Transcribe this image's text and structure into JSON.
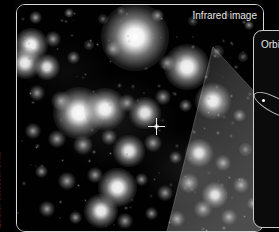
{
  "figure": {
    "credit": "ESO/S. Gillessen et al.",
    "background_color": "#000000"
  },
  "image_panel": {
    "label": "Infrared image",
    "border_color": "#d8d8d8",
    "marker": {
      "name": "central-source-crosshair",
      "description": "crosshair"
    }
  },
  "orbit_panel": {
    "label": "Orbit",
    "border_color": "#c9c9c9",
    "background_color": "#0b0b0b"
  },
  "chart_data": {
    "type": "scatter",
    "title": "Infrared image",
    "xlabel": "",
    "ylabel": "",
    "legend": [
      "Infrared image",
      "Orbit"
    ],
    "annotations": [
      "Infrared image",
      "Orbit",
      "ESO/S. Gillessen et al."
    ],
    "grid": false,
    "xlim": [
      0,
      246
    ],
    "ylim": [
      0,
      226
    ],
    "series": [
      {
        "name": "stars",
        "points": [
          {
            "x": 18,
            "y": 12,
            "brightness": 0.5,
            "size": 5
          },
          {
            "x": 52,
            "y": 8,
            "brightness": 0.45,
            "size": 4
          },
          {
            "x": 86,
            "y": 14,
            "brightness": 0.4,
            "size": 4
          },
          {
            "x": 104,
            "y": 6,
            "brightness": 0.35,
            "size": 3
          },
          {
            "x": 140,
            "y": 10,
            "brightness": 0.55,
            "size": 5
          },
          {
            "x": 176,
            "y": 16,
            "brightness": 0.4,
            "size": 4
          },
          {
            "x": 210,
            "y": 10,
            "brightness": 0.35,
            "size": 3
          },
          {
            "x": 232,
            "y": 20,
            "brightness": 0.45,
            "size": 4
          },
          {
            "x": 14,
            "y": 40,
            "brightness": 0.85,
            "size": 13
          },
          {
            "x": 36,
            "y": 34,
            "brightness": 0.5,
            "size": 6
          },
          {
            "x": 8,
            "y": 58,
            "brightness": 0.8,
            "size": 12
          },
          {
            "x": 30,
            "y": 62,
            "brightness": 0.7,
            "size": 10
          },
          {
            "x": 56,
            "y": 52,
            "brightness": 0.45,
            "size": 5
          },
          {
            "x": 72,
            "y": 40,
            "brightness": 0.4,
            "size": 4
          },
          {
            "x": 96,
            "y": 44,
            "brightness": 0.5,
            "size": 6
          },
          {
            "x": 118,
            "y": 32,
            "brightness": 0.95,
            "size": 26
          },
          {
            "x": 150,
            "y": 58,
            "brightness": 0.5,
            "size": 6
          },
          {
            "x": 170,
            "y": 62,
            "brightness": 0.85,
            "size": 18
          },
          {
            "x": 200,
            "y": 46,
            "brightness": 0.4,
            "size": 5
          },
          {
            "x": 226,
            "y": 52,
            "brightness": 0.35,
            "size": 4
          },
          {
            "x": 20,
            "y": 88,
            "brightness": 0.5,
            "size": 6
          },
          {
            "x": 44,
            "y": 96,
            "brightness": 0.6,
            "size": 8
          },
          {
            "x": 62,
            "y": 108,
            "brightness": 0.9,
            "size": 20
          },
          {
            "x": 88,
            "y": 104,
            "brightness": 0.85,
            "size": 16
          },
          {
            "x": 110,
            "y": 98,
            "brightness": 0.55,
            "size": 7
          },
          {
            "x": 128,
            "y": 108,
            "brightness": 0.75,
            "size": 12
          },
          {
            "x": 146,
            "y": 92,
            "brightness": 0.5,
            "size": 6
          },
          {
            "x": 168,
            "y": 100,
            "brightness": 0.45,
            "size": 5
          },
          {
            "x": 196,
            "y": 96,
            "brightness": 0.8,
            "size": 14
          },
          {
            "x": 222,
            "y": 110,
            "brightness": 0.45,
            "size": 5
          },
          {
            "x": 16,
            "y": 126,
            "brightness": 0.5,
            "size": 6
          },
          {
            "x": 40,
            "y": 134,
            "brightness": 0.55,
            "size": 7
          },
          {
            "x": 66,
            "y": 140,
            "brightness": 0.6,
            "size": 8
          },
          {
            "x": 92,
            "y": 132,
            "brightness": 0.5,
            "size": 6
          },
          {
            "x": 112,
            "y": 146,
            "brightness": 0.75,
            "size": 12
          },
          {
            "x": 136,
            "y": 138,
            "brightness": 0.55,
            "size": 7
          },
          {
            "x": 158,
            "y": 152,
            "brightness": 0.45,
            "size": 5
          },
          {
            "x": 182,
            "y": 148,
            "brightness": 0.7,
            "size": 11
          },
          {
            "x": 206,
            "y": 158,
            "brightness": 0.5,
            "size": 6
          },
          {
            "x": 228,
            "y": 144,
            "brightness": 0.4,
            "size": 5
          },
          {
            "x": 24,
            "y": 166,
            "brightness": 0.45,
            "size": 5
          },
          {
            "x": 50,
            "y": 176,
            "brightness": 0.55,
            "size": 7
          },
          {
            "x": 78,
            "y": 170,
            "brightness": 0.5,
            "size": 6
          },
          {
            "x": 100,
            "y": 182,
            "brightness": 0.85,
            "size": 15
          },
          {
            "x": 124,
            "y": 174,
            "brightness": 0.45,
            "size": 5
          },
          {
            "x": 148,
            "y": 188,
            "brightness": 0.5,
            "size": 6
          },
          {
            "x": 172,
            "y": 178,
            "brightness": 0.6,
            "size": 8
          },
          {
            "x": 198,
            "y": 190,
            "brightness": 0.7,
            "size": 10
          },
          {
            "x": 224,
            "y": 180,
            "brightness": 0.5,
            "size": 6
          },
          {
            "x": 30,
            "y": 204,
            "brightness": 0.5,
            "size": 6
          },
          {
            "x": 58,
            "y": 212,
            "brightness": 0.45,
            "size": 5
          },
          {
            "x": 84,
            "y": 206,
            "brightness": 0.8,
            "size": 13
          },
          {
            "x": 108,
            "y": 216,
            "brightness": 0.5,
            "size": 6
          },
          {
            "x": 134,
            "y": 208,
            "brightness": 0.45,
            "size": 5
          },
          {
            "x": 160,
            "y": 214,
            "brightness": 0.5,
            "size": 6
          },
          {
            "x": 186,
            "y": 204,
            "brightness": 0.55,
            "size": 7
          },
          {
            "x": 212,
            "y": 212,
            "brightness": 0.5,
            "size": 6
          },
          {
            "x": 236,
            "y": 198,
            "brightness": 0.45,
            "size": 5
          }
        ]
      }
    ]
  }
}
